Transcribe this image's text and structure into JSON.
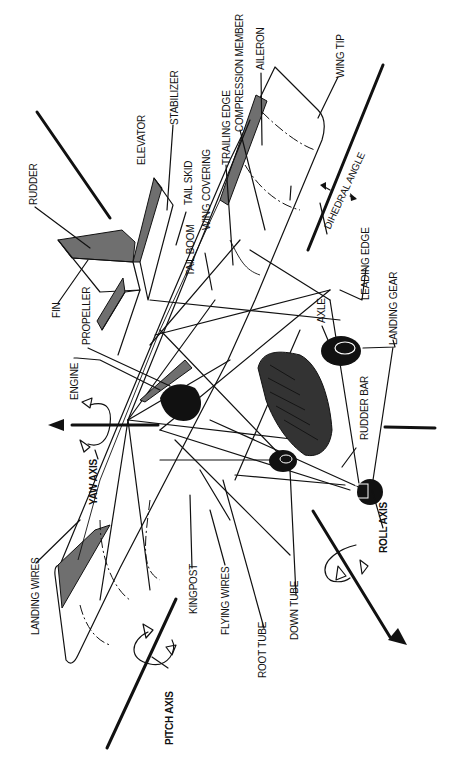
{
  "diagram": {
    "orientation": "rotated 90 degrees clockwise",
    "labels": {
      "rudder": "RUDDER",
      "elevator": "ELEVATOR",
      "stabilizer": "STABILIZER",
      "tail_skid": "TAIL SKID",
      "tail_boom": "TAIL BOOM",
      "wing_covering": "WING COVERING",
      "trailing_edge": "TRAILING EDGE",
      "compression_member": "COMPRESSION MEMBER",
      "aileron": "AILERON",
      "wing_tip": "WING TIP",
      "dihedral_angle": "DIHEDRAL ANGLE",
      "leading_edge": "LEADING EDGE",
      "landing_gear": "LANDING GEAR",
      "axle": "AXLE",
      "rudder_bar": "RUDDER BAR",
      "fin": "FIN",
      "propeller": "PROPELLER",
      "engine": "ENGINE",
      "yaw_axis": "YAW AXIS",
      "landing_wires": "LANDING WIRES",
      "kingpost": "KINGPOST",
      "flying_wires": "FLYING WIRES",
      "root_tube": "ROOT TUBE",
      "down_tube": "DOWN TUBE",
      "roll_axis": "ROLL AXIS",
      "pitch_axis": "PITCH AXIS"
    },
    "colors": {
      "ink": "#111111",
      "shading": "#6f6f6f",
      "background": "#ffffff"
    }
  }
}
